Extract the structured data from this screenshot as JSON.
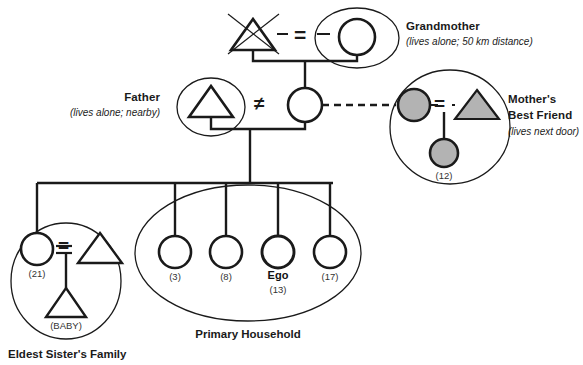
{
  "diagram": {
    "colors": {
      "line": "#1a1a1a",
      "fill_gray": "#b3b3b3",
      "background": "#ffffff",
      "text": "#1a1a1a"
    }
  },
  "labels": {
    "grandmother": {
      "title": "Grandmother",
      "note": "(lives alone; 50 km distance)"
    },
    "father": {
      "title": "Father",
      "note": "(lives alone; nearby)"
    },
    "mothers_best_friend": {
      "title_line1": "Mother's",
      "title_line2": "Best Friend",
      "note": "(lives next door)"
    },
    "primary_household": {
      "title": "Primary Household"
    },
    "eldest_sisters_family": {
      "title": "Eldest Sister's Family"
    }
  },
  "people": {
    "grandfather": {
      "symbol": "triangle",
      "deceased": true,
      "age": ""
    },
    "grandmother": {
      "symbol": "circle",
      "age": ""
    },
    "father": {
      "symbol": "triangle",
      "age": ""
    },
    "mother": {
      "symbol": "circle",
      "age": ""
    },
    "best_friend_adult_female": {
      "symbol": "circle",
      "filled": true,
      "age": ""
    },
    "best_friend_adult_male": {
      "symbol": "triangle",
      "filled": true,
      "age": ""
    },
    "best_friend_child": {
      "symbol": "circle",
      "filled": true,
      "age": "(12)"
    },
    "eldest_sister": {
      "symbol": "circle",
      "age": "(21)"
    },
    "eldest_sister_partner": {
      "symbol": "triangle",
      "age": ""
    },
    "eldest_sister_baby": {
      "symbol": "triangle",
      "age": "(BABY)"
    },
    "child_1": {
      "symbol": "circle",
      "age": "(3)"
    },
    "child_2": {
      "symbol": "circle",
      "age": "(8)"
    },
    "ego": {
      "symbol": "circle",
      "name": "Ego",
      "age": "(13)"
    },
    "child_4": {
      "symbol": "circle",
      "age": "(17)"
    }
  },
  "relations": {
    "grandparents_marriage": "=",
    "parents_separated": "≠",
    "best_friend_marriage": "=",
    "eldest_sister_marriage": "=",
    "mother_to_best_friend": "dashed-close-tie"
  }
}
